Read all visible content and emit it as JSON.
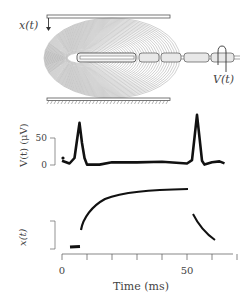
{
  "figure": {
    "schematic": {
      "displacement_label": "x(t)",
      "voltage_label": "V(t)"
    },
    "voltage_panel": {
      "ylabel": "V(t) (μV)",
      "scale_bar_ticks": [
        "50",
        "0"
      ]
    },
    "displacement_panel": {
      "ylabel": "x(t)"
    },
    "time_axis": {
      "xlabel": "Time (ms)",
      "tick_labels": [
        "0",
        "50"
      ]
    }
  },
  "chart_data": [
    {
      "type": "line",
      "title": "",
      "xlabel": "Time (ms)",
      "ylabel": "V(t) (μV)",
      "xlim": [
        0,
        70
      ],
      "ylim": [
        0,
        100
      ],
      "yticks": [
        0,
        50
      ],
      "grid": false,
      "series": [
        {
          "name": "V(t)",
          "x": [
            0,
            3,
            5,
            6,
            7,
            8,
            9,
            10,
            12,
            15,
            20,
            30,
            40,
            50,
            52,
            53,
            54,
            55,
            56,
            57,
            60,
            63,
            65
          ],
          "y": [
            5,
            2,
            10,
            45,
            75,
            40,
            10,
            0,
            -2,
            0,
            2,
            4,
            3,
            2,
            6,
            50,
            90,
            50,
            5,
            0,
            2,
            6,
            0
          ]
        }
      ]
    },
    {
      "type": "line",
      "title": "",
      "xlabel": "Time (ms)",
      "ylabel": "x(t)",
      "xlim": [
        0,
        70
      ],
      "grid": false,
      "series": [
        {
          "name": "x(t)",
          "x": [
            3,
            6,
            7.5,
            8,
            10,
            15,
            20,
            30,
            40,
            50
          ],
          "y": [
            0,
            0,
            0.3,
            0.35,
            0.75,
            0.95,
            1.05,
            1.12,
            1.15,
            1.16
          ]
        },
        {
          "name": "x(t) release",
          "x": [
            52.5,
            55,
            58,
            61
          ],
          "y": [
            0.75,
            0.55,
            0.35,
            0.2
          ]
        }
      ]
    }
  ]
}
